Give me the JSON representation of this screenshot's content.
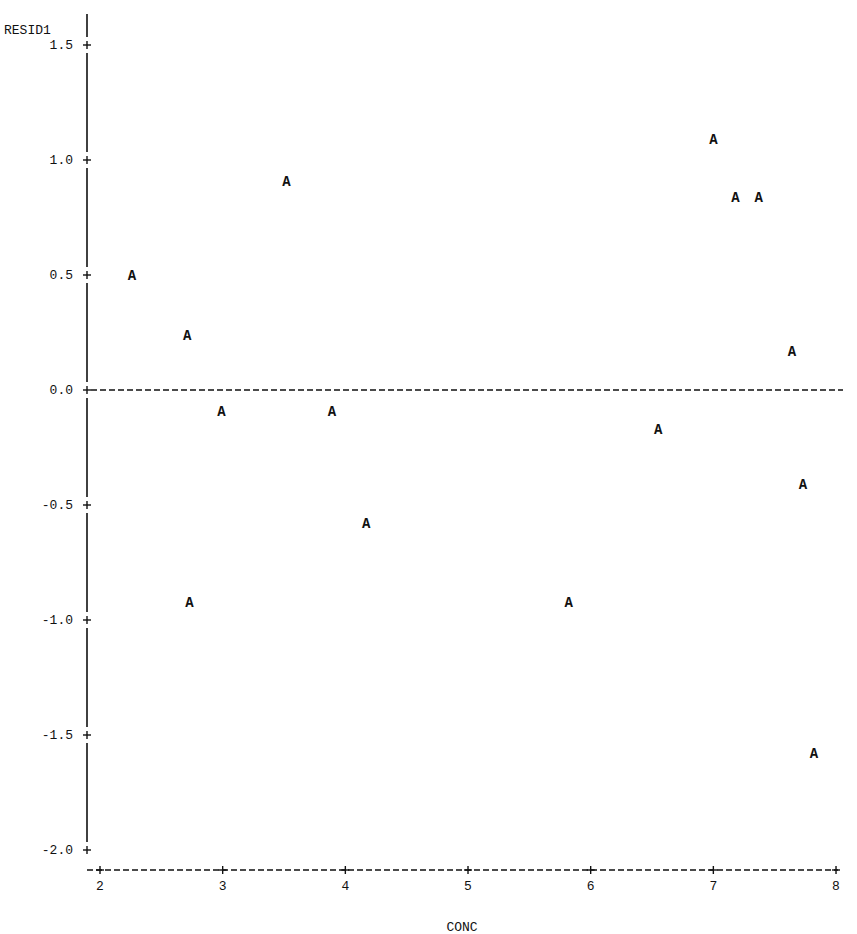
{
  "chart_data": {
    "type": "scatter",
    "title": "",
    "xlabel": "CONC",
    "ylabel": "RESID1",
    "marker_symbol": "A",
    "xlim": [
      2,
      8
    ],
    "ylim": [
      -2.0,
      1.5
    ],
    "x_ticks": [
      2,
      3,
      4,
      5,
      6,
      7,
      8
    ],
    "x_tick_labels": [
      "2",
      "3",
      "4",
      "5",
      "6",
      "7",
      "8"
    ],
    "y_ticks": [
      1.5,
      1.0,
      0.5,
      0.0,
      -0.5,
      -1.0,
      -1.5,
      -2.0
    ],
    "y_tick_labels": [
      "1.5",
      "1.0",
      "0.5",
      "0.0",
      "-0.5",
      "-1.0",
      "-1.5",
      "-2.0"
    ],
    "reference_line": {
      "y": 0.0,
      "style": "dashed"
    },
    "grid": false,
    "legend": null,
    "points": [
      {
        "x": 2.26,
        "y": 0.5
      },
      {
        "x": 2.71,
        "y": 0.24
      },
      {
        "x": 2.73,
        "y": -0.92
      },
      {
        "x": 2.99,
        "y": -0.09
      },
      {
        "x": 3.52,
        "y": 0.91
      },
      {
        "x": 3.89,
        "y": -0.09
      },
      {
        "x": 4.17,
        "y": -0.58
      },
      {
        "x": 5.82,
        "y": -0.92
      },
      {
        "x": 6.55,
        "y": -0.17
      },
      {
        "x": 7.0,
        "y": 1.09
      },
      {
        "x": 7.18,
        "y": 0.84
      },
      {
        "x": 7.37,
        "y": 0.84
      },
      {
        "x": 7.64,
        "y": 0.17
      },
      {
        "x": 7.73,
        "y": -0.41
      },
      {
        "x": 7.82,
        "y": -1.58
      }
    ]
  },
  "colors": {
    "ink": "#111111",
    "background": "#ffffff"
  }
}
